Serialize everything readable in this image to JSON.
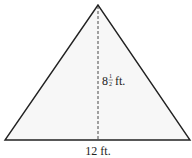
{
  "figure": {
    "shape": "triangle",
    "base_label": "12 ft.",
    "height_label_whole": "8",
    "height_label_num": "1",
    "height_label_den": "2",
    "height_label_unit": "ft."
  },
  "colors": {
    "stroke": "#222222",
    "fill": "#f7f7f7",
    "background": "#ffffff"
  }
}
